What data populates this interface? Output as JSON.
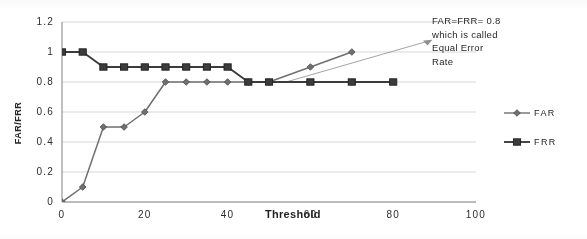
{
  "chart_data": {
    "type": "line",
    "title": "",
    "xlabel": "Threshold",
    "ylabel": "FAR/FRR",
    "xlim": [
      0,
      100
    ],
    "ylim": [
      0,
      1.2
    ],
    "grid": true,
    "grid_axis": "y",
    "legend_position": "right",
    "xticks": [
      "0",
      "20",
      "40",
      "60",
      "80",
      "100"
    ],
    "xtick_values": [
      0,
      20,
      40,
      60,
      80,
      100
    ],
    "yticks": [
      "0",
      "0.2",
      "0.4",
      "0.6",
      "0.8",
      "1",
      "1.2"
    ],
    "ytick_values": [
      0,
      0.2,
      0.4,
      0.6,
      0.8,
      1,
      1.2
    ],
    "series": [
      {
        "name": "FAR",
        "marker": "diamond",
        "color": "#6f6f6f",
        "x": [
          0,
          5,
          10,
          15,
          20,
          25,
          30,
          35,
          40,
          45,
          50,
          60,
          70
        ],
        "values": [
          0,
          0.1,
          0.5,
          0.5,
          0.6,
          0.8,
          0.8,
          0.8,
          0.8,
          0.8,
          0.8,
          0.9,
          1.0
        ]
      },
      {
        "name": "FRR",
        "marker": "square",
        "color": "#3a3a3a",
        "x": [
          0,
          5,
          10,
          15,
          20,
          25,
          30,
          35,
          40,
          45,
          50,
          60,
          70,
          80
        ],
        "values": [
          1.0,
          1.0,
          0.9,
          0.9,
          0.9,
          0.9,
          0.9,
          0.9,
          0.9,
          0.8,
          0.8,
          0.8,
          0.8,
          0.8
        ]
      }
    ],
    "annotations": [
      {
        "name": "equal-error-rate-note",
        "lines": [
          "FAR=FRR= 0.8",
          "which is called",
          "Equal Error",
          "Rate"
        ],
        "points_to_x": 50,
        "points_to_y": 0.8
      }
    ]
  },
  "legend": {
    "items": [
      {
        "label": "FAR",
        "marker": "diamond"
      },
      {
        "label": "FRR",
        "marker": "square"
      }
    ]
  }
}
